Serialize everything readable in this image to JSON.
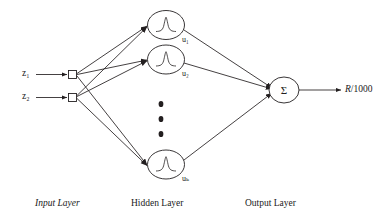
{
  "diagram": {
    "background_color": "#ffffff",
    "stroke_color": "#231f20",
    "inputs": [
      {
        "label": "z",
        "subscript": "1",
        "text": "z₁"
      },
      {
        "label": "z",
        "subscript": "2",
        "text": "z₂"
      }
    ],
    "hidden_units": [
      {
        "label": "u",
        "subscript": "1",
        "text": "u₁",
        "activation": "gaussian-rbf"
      },
      {
        "label": "u",
        "subscript": "2",
        "text": "u₂",
        "activation": "gaussian-rbf"
      },
      {
        "label": "u",
        "subscript": "k",
        "text": "uₖ",
        "activation": "gaussian-rbf"
      }
    ],
    "ellipsis": {
      "dots": 3,
      "orientation": "vertical"
    },
    "output_node": {
      "symbol": "Σ",
      "name": "summation"
    },
    "output_arrow_label": {
      "variable": "R",
      "divisor": "/1000",
      "text": "R/1000"
    },
    "captions": [
      {
        "text": "Input Layer",
        "style": "italic"
      },
      {
        "text": "Hidden Layer",
        "style": "normal"
      },
      {
        "text": "Output Layer",
        "style": "normal"
      }
    ]
  }
}
